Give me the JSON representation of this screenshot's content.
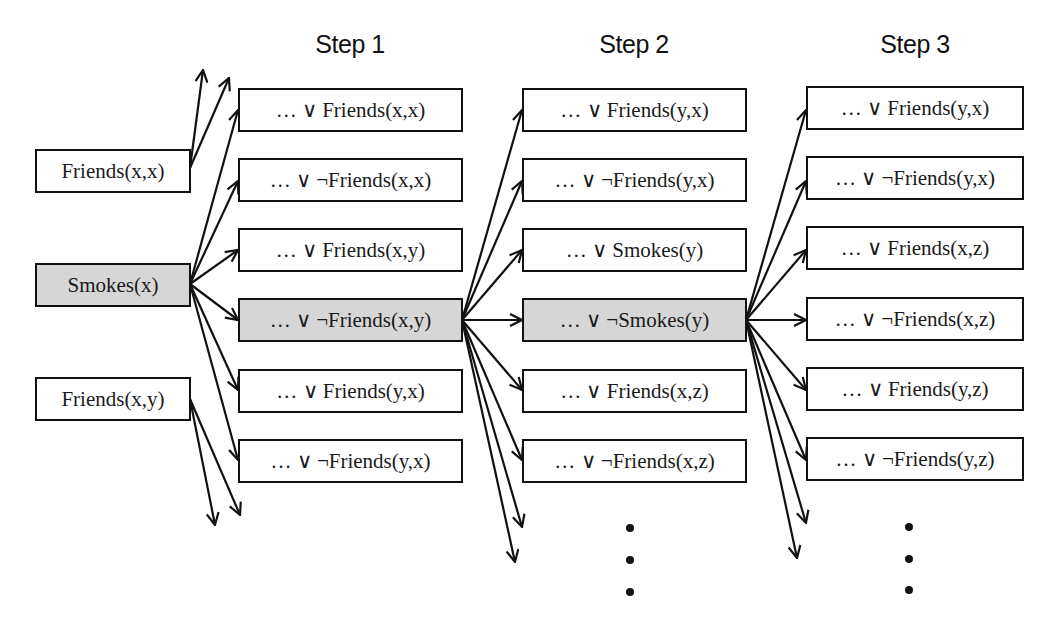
{
  "diagram": {
    "type": "clause-expansion-tree",
    "colors": {
      "highlight_fill": "#d6d6d6",
      "stroke": "#111111",
      "background": "#ffffff"
    },
    "steps": [
      {
        "label": "Step 1"
      },
      {
        "label": "Step 2"
      },
      {
        "label": "Step 3"
      }
    ],
    "initial_literals": [
      {
        "label": "Friends(x,x)",
        "highlighted": false
      },
      {
        "label": "Smokes(x)",
        "highlighted": true
      },
      {
        "label": "Friends(x,y)",
        "highlighted": false
      }
    ],
    "step1_clauses": [
      {
        "label": "… ∨ Friends(x,x)",
        "highlighted": false
      },
      {
        "label": "… ∨ ¬Friends(x,x)",
        "highlighted": false
      },
      {
        "label": "… ∨ Friends(x,y)",
        "highlighted": false
      },
      {
        "label": "… ∨ ¬Friends(x,y)",
        "highlighted": true
      },
      {
        "label": "… ∨ Friends(y,x)",
        "highlighted": false
      },
      {
        "label": "… ∨ ¬Friends(y,x)",
        "highlighted": false
      }
    ],
    "step2_clauses": [
      {
        "label": "… ∨ Friends(y,x)",
        "highlighted": false
      },
      {
        "label": "… ∨ ¬Friends(y,x)",
        "highlighted": false
      },
      {
        "label": "… ∨ Smokes(y)",
        "highlighted": false
      },
      {
        "label": "… ∨ ¬Smokes(y)",
        "highlighted": true
      },
      {
        "label": "… ∨ Friends(x,z)",
        "highlighted": false
      },
      {
        "label": "… ∨ ¬Friends(x,z)",
        "highlighted": false
      }
    ],
    "step3_clauses": [
      {
        "label": "… ∨ Friends(y,x)",
        "highlighted": false
      },
      {
        "label": "… ∨ ¬Friends(y,x)",
        "highlighted": false
      },
      {
        "label": "… ∨ Friends(x,z)",
        "highlighted": false
      },
      {
        "label": "… ∨ ¬Friends(x,z)",
        "highlighted": false
      },
      {
        "label": "… ∨ Friends(y,z)",
        "highlighted": false
      },
      {
        "label": "… ∨ ¬Friends(y,z)",
        "highlighted": false
      }
    ],
    "continuation_marker": "⋮",
    "edges": [
      {
        "from": "Friends(x,x)",
        "to": "off-diagram (up)"
      },
      {
        "from": "Friends(x,x)",
        "to": "off-diagram (up)"
      },
      {
        "from": "Smokes(x)",
        "to": "step1.0"
      },
      {
        "from": "Smokes(x)",
        "to": "step1.1"
      },
      {
        "from": "Smokes(x)",
        "to": "step1.2"
      },
      {
        "from": "Smokes(x)",
        "to": "step1.3"
      },
      {
        "from": "Smokes(x)",
        "to": "step1.4"
      },
      {
        "from": "Smokes(x)",
        "to": "step1.5"
      },
      {
        "from": "Friends(x,y)",
        "to": "off-diagram (down)"
      },
      {
        "from": "Friends(x,y)",
        "to": "off-diagram (down)"
      },
      {
        "from": "step1.3",
        "to": "step2.0"
      },
      {
        "from": "step1.3",
        "to": "step2.1"
      },
      {
        "from": "step1.3",
        "to": "step2.2"
      },
      {
        "from": "step1.3",
        "to": "step2.3"
      },
      {
        "from": "step1.3",
        "to": "step2.4"
      },
      {
        "from": "step1.3",
        "to": "step2.5"
      },
      {
        "from": "step1.3",
        "to": "more (down)"
      },
      {
        "from": "step1.3",
        "to": "more (down)"
      },
      {
        "from": "step2.3",
        "to": "step3.0"
      },
      {
        "from": "step2.3",
        "to": "step3.1"
      },
      {
        "from": "step2.3",
        "to": "step3.2"
      },
      {
        "from": "step2.3",
        "to": "step3.3"
      },
      {
        "from": "step2.3",
        "to": "step3.4"
      },
      {
        "from": "step2.3",
        "to": "step3.5"
      },
      {
        "from": "step2.3",
        "to": "more (down)"
      },
      {
        "from": "step2.3",
        "to": "more (down)"
      }
    ]
  }
}
